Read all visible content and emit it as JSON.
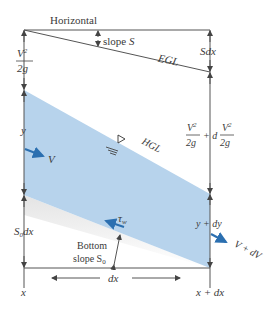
{
  "diagram": {
    "labels": {
      "horizontal": "Horizontal",
      "slope_s_prefix": "slope ",
      "slope_s_var": "S",
      "egl": "EGL",
      "sdx": "Sdx",
      "v2_num": "V",
      "v2_exp": "2",
      "v2_den": "2g",
      "head_right_plus": "+ d",
      "hgl": "HGL",
      "y": "y",
      "v": "V",
      "y_dy": "y + dy",
      "v_dv": "V + dV",
      "s0dx": "S",
      "s0dx_sub": "0",
      "s0dx_tail": "dx",
      "tau": "τ",
      "tau_sub": "w",
      "bottom_line1": "Bottom",
      "bottom_line2": "slope S",
      "bottom_sub": "0",
      "dx": "dx",
      "x": "x",
      "x_dx": "x + dx"
    },
    "colors": {
      "water": "#b7d3ec",
      "water_edge": "#8fb6dc",
      "arrow_blue": "#2b6fb0",
      "line": "#555555",
      "text": "#3a3a3a"
    }
  }
}
